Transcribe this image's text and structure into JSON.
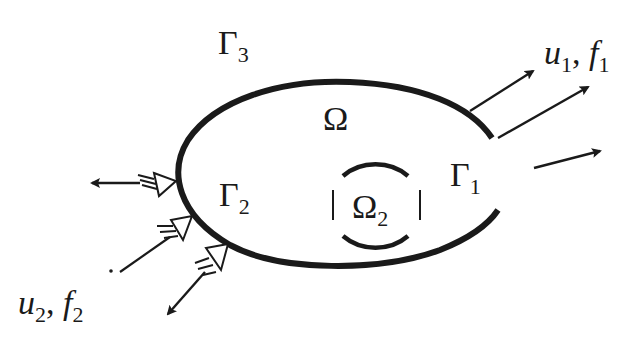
{
  "diagram": {
    "type": "domain-boundary schematic",
    "colors": {
      "ink": "#1a1a1a",
      "background": "#ffffff"
    },
    "labels": {
      "gamma3": {
        "base": "Γ",
        "sub": "3"
      },
      "omega": {
        "base": "Ω",
        "sub": ""
      },
      "gamma1": {
        "base": "Γ",
        "sub": "1"
      },
      "gamma2": {
        "base": "Γ",
        "sub": "2"
      },
      "omega2": {
        "base": "Ω",
        "sub": "2"
      },
      "u1f1": {
        "u": "u",
        "u_sub": "1",
        "sep": ", ",
        "f": "f",
        "f_sub": "1"
      },
      "u2f2": {
        "u": "u",
        "u_sub": "2",
        "sep": ", ",
        "f": "f",
        "f_sub": "2"
      }
    },
    "elements": [
      "outer boundary curve (open on right, Γ1 gap)",
      "inner dashed circle Ω2",
      "two solid arrows from upper-right boundary (u1, f1)",
      "free arrow on right",
      "three hollow-arrow double-headed connectors on left boundary Γ2 (u2, f2)"
    ]
  }
}
